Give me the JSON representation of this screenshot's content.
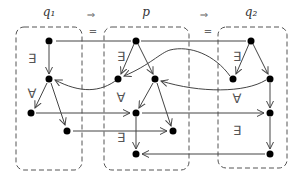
{
  "labels": {
    "q1": "q₁",
    "p": "p",
    "q2": "q₂"
  },
  "implies": [
    "⇒",
    "⇒"
  ],
  "equals": [
    "=",
    "="
  ],
  "quantifiers": {
    "q1_exists": "∃",
    "q1_forall": "∀",
    "p_exists_top": "∃",
    "p_forall": "∀",
    "p_exists_bottom": "∃",
    "q2_exists_top": "∃",
    "q2_forall": "∀",
    "q2_exists_bottom": "∃"
  },
  "colors": {
    "node": "#000000",
    "edge": "#444444",
    "box": "#555555"
  }
}
